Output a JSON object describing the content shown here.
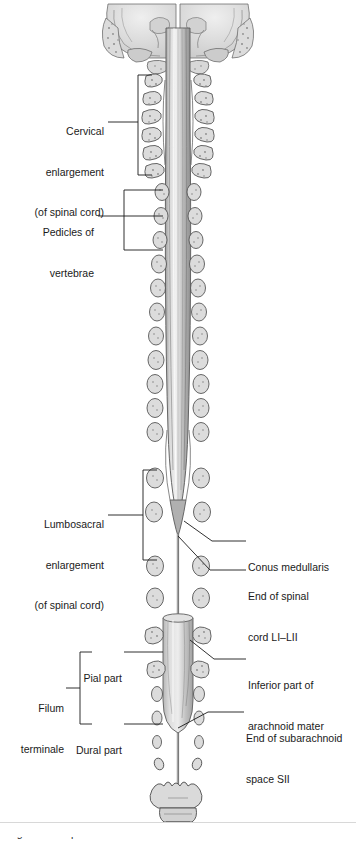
{
  "figure": {
    "view": "posterior coronal section",
    "background_color": "#ffffff",
    "ink_color": "#1a1a1a",
    "cord_fill": "#c9c9c9",
    "bone_fill": "#d5d5d5",
    "dura_fill": "#bdbdbd"
  },
  "labels": {
    "cervical_enlargement": {
      "lines": [
        "Cervical",
        "enlargement",
        "(of spinal cord)"
      ],
      "side": "left",
      "connector": "bracket"
    },
    "pedicles": {
      "lines": [
        "Pedicles of",
        "vertebrae"
      ],
      "side": "left",
      "connector": "bracket"
    },
    "lumbosacral_enlargement": {
      "lines": [
        "Lumbosacral",
        "enlargement",
        "(of spinal cord)"
      ],
      "side": "left",
      "connector": "bracket"
    },
    "conus_medullaris": {
      "lines": [
        "Conus medullaris"
      ],
      "side": "right",
      "connector": "leader"
    },
    "end_of_spinal_cord": {
      "lines": [
        "End of spinal",
        "cord LI–LII"
      ],
      "side": "right",
      "connector": "leader"
    },
    "inferior_arachnoid": {
      "lines": [
        "Inferior part of",
        "arachnoid mater"
      ],
      "side": "right",
      "connector": "leader"
    },
    "end_of_subarachnoid": {
      "lines": [
        "End of subarachnoid",
        "space SII"
      ],
      "side": "right",
      "connector": "leader"
    },
    "pial_part": {
      "lines": [
        "Pial part"
      ],
      "side": "left",
      "connector": "leader"
    },
    "dural_part": {
      "lines": [
        "Dural part"
      ],
      "side": "left",
      "connector": "leader"
    },
    "filum_terminale": {
      "lines": [
        "Filum",
        "terminale"
      ],
      "side": "left",
      "connector": "bracket"
    }
  },
  "caption": {
    "text": "Figure 2.51 Spinal cord."
  },
  "structures": {
    "cranial_base": "occipital bone and petrous temporal bones",
    "spinal_cord": "spinal cord with cervical and lumbosacral enlargements",
    "pedicles_left_count": 24,
    "pedicles_right_count": 24,
    "dural_sac": "lumbar cistern / dural sac ending at SII",
    "sacrum": "sacrum",
    "coccyx": "coccyx"
  }
}
